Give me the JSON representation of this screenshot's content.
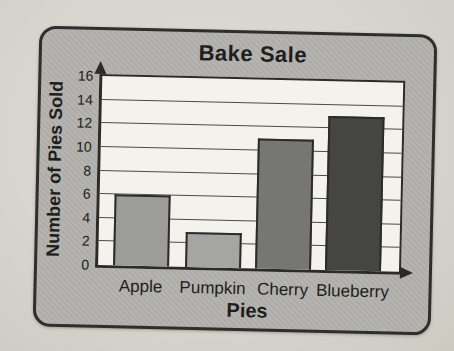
{
  "page": {
    "background_color": "#d8d6cf"
  },
  "chart_data": {
    "type": "bar",
    "title": "Bake Sale",
    "xlabel": "Pies",
    "ylabel": "Number of Pies Sold",
    "categories": [
      "Apple",
      "Pumpkin",
      "Cherry",
      "Blueberry"
    ],
    "values": [
      6,
      3,
      11,
      13
    ],
    "ylim": [
      0,
      16
    ],
    "yticks": [
      0,
      2,
      4,
      6,
      8,
      10,
      12,
      14,
      16
    ],
    "grid": "horizontal gridlines at every tick",
    "legend_position": "none",
    "bar_colors": [
      "#9c9d9a",
      "#a5a6a3",
      "#767773",
      "#454643"
    ],
    "bar_border_color": "#2b2b28",
    "axis_color": "#2b2b28",
    "axis_arrows": [
      "y-axis-up",
      "x-axis-right"
    ],
    "plot_background": "#f3f2ed",
    "card_background": "#b3b2ae",
    "card_border_color": "#2e2e2b",
    "text_color": "#1e1e1c"
  }
}
